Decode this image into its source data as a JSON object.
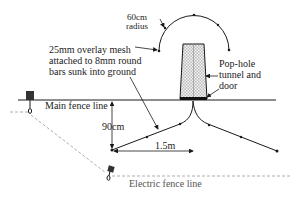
{
  "diagram": {
    "labels": {
      "radius": "60cm\nradius",
      "radius_line1": "60cm",
      "radius_line2": "radius",
      "mesh": "25mm overlay mesh\nattached to 8mm round\nbars sunk into ground",
      "pophole": "Pop-hole\ntunnel and\ndoor",
      "main_fence": "Main fence line",
      "depth": "90cm",
      "width": "1.5m",
      "electric_fence": "Electric fence line"
    },
    "colors": {
      "line": "#1a1a1a",
      "dashed": "#9a9a9a",
      "mesh_fill": "#d8d8d8",
      "post": "#333333"
    }
  }
}
